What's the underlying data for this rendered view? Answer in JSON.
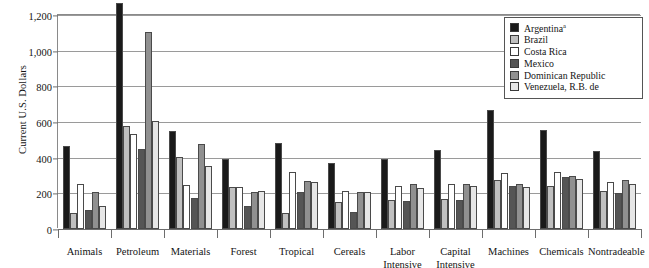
{
  "chart_data": {
    "type": "bar",
    "title": "",
    "xlabel": "",
    "ylabel": "Current U.S. Dollars",
    "ylim": [
      0,
      1200
    ],
    "ytick_values": [
      0,
      200,
      400,
      600,
      800,
      1000,
      1200
    ],
    "ytick_labels": [
      "0",
      "200",
      "400",
      "600",
      "800",
      "1,000",
      "1,200"
    ],
    "grid": true,
    "legend_position": "top-right",
    "categories": [
      "Animals",
      "Petroleum",
      "Materials",
      "Forest",
      "Tropical",
      "Cereals",
      "Labor\nIntensive",
      "Capital\nIntensive",
      "Machines",
      "Chemicals",
      "Nontradeable"
    ],
    "series": [
      {
        "name": "Argentina",
        "superscript": "a",
        "color": "#1a1a1a",
        "values": [
          465,
          1265,
          550,
          395,
          480,
          370,
          395,
          445,
          670,
          555,
          435
        ]
      },
      {
        "name": "Brazil",
        "superscript": "",
        "color": "#c0c0c0",
        "values": [
          90,
          575,
          405,
          235,
          90,
          150,
          165,
          170,
          275,
          240,
          215
        ]
      },
      {
        "name": "Costa Rica",
        "superscript": "",
        "color": "#ffffff",
        "values": [
          250,
          535,
          245,
          235,
          320,
          215,
          240,
          250,
          315,
          320,
          265
        ]
      },
      {
        "name": "Mexico",
        "superscript": "",
        "color": "#555555",
        "values": [
          105,
          450,
          175,
          130,
          205,
          95,
          155,
          160,
          240,
          290,
          200
        ]
      },
      {
        "name": "Dominican Republic",
        "superscript": "",
        "color": "#909090",
        "values": [
          205,
          1105,
          475,
          205,
          270,
          205,
          250,
          255,
          255,
          300,
          275
        ]
      },
      {
        "name": "Venezuela, R.B. de",
        "superscript": "",
        "color": "#e6e6e6",
        "values": [
          130,
          605,
          355,
          215,
          265,
          210,
          230,
          240,
          235,
          280,
          250
        ]
      }
    ]
  }
}
